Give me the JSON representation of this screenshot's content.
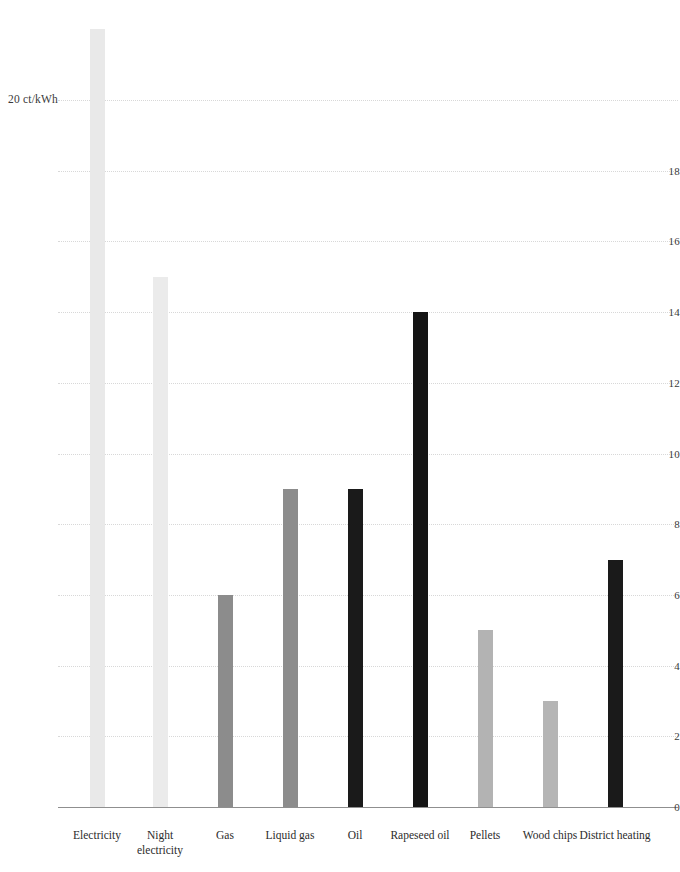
{
  "chart_data": {
    "type": "bar",
    "title": "",
    "subtitle": "",
    "xlabel": "",
    "ylabel": "ct/kWh",
    "y_axis_unit_label": "20 ct/kWh",
    "ylim": [
      0,
      20
    ],
    "y_ticks": [
      0,
      2,
      4,
      6,
      8,
      10,
      12,
      14,
      16,
      18,
      20
    ],
    "y_tick_labels": [
      "0",
      "2",
      "4",
      "6",
      "8",
      "10",
      "12",
      "14",
      "16",
      "18",
      "20 ct/kWh"
    ],
    "grid": true,
    "legend": "none",
    "categories": [
      "Electricity",
      "Night electricity",
      "Gas",
      "Liquid gas",
      "Oil",
      "Rapeseed oil",
      "Pellets",
      "Wood chips",
      "District heating"
    ],
    "values": [
      22,
      15,
      6,
      9,
      9,
      14,
      5,
      3,
      7
    ],
    "bar_colors": [
      "#e9e9e9",
      "#ebebeb",
      "#8c8c8c",
      "#8c8c8c",
      "#1a1a1a",
      "#141414",
      "#b3b3b3",
      "#b5b5b5",
      "#1a1a1a"
    ]
  },
  "axis": {
    "grid_color": "#d8d8d8",
    "axis_color": "#8f8f8f",
    "text_color": "#2b2b2b"
  }
}
